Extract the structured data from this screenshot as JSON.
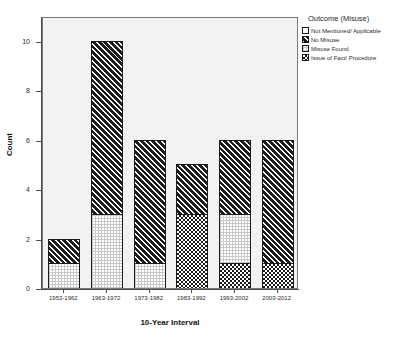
{
  "chart_data": {
    "type": "bar",
    "stacked": true,
    "title": "",
    "xlabel": "10-Year Interval",
    "ylabel": "Count",
    "ylim": [
      0,
      11
    ],
    "yticks": [
      0,
      2,
      4,
      6,
      8,
      10
    ],
    "grid": false,
    "legend_position": "right",
    "legend_title": "Outcome (Misuse)",
    "categories": [
      "1953-1962",
      "1963-1972",
      "1973-1982",
      "1983-1992",
      "1993-2002",
      "2003-2012"
    ],
    "series": [
      {
        "name": "Not Mentioned/ Applicable",
        "pattern": "blank",
        "values": [
          0,
          0,
          0,
          0,
          0,
          0
        ]
      },
      {
        "name": "No Misuse",
        "pattern": "diagonal-hatch",
        "values": [
          1,
          7,
          5,
          2,
          3,
          5
        ]
      },
      {
        "name": "Misuse Found",
        "pattern": "fine-dots",
        "values": [
          1,
          3,
          1,
          0,
          2,
          0
        ]
      },
      {
        "name": "Issue of Fact/ Procedure",
        "pattern": "checkerboard",
        "values": [
          0,
          0,
          0,
          3,
          1,
          1
        ]
      }
    ],
    "totals": [
      2,
      10,
      6,
      5,
      6,
      6
    ]
  },
  "axes": {
    "y_tick_labels": [
      "0",
      "2",
      "4",
      "6",
      "8",
      "10"
    ],
    "y_axis_title": "Count",
    "x_axis_title": "10-Year Interval",
    "x_tick_labels": [
      "1953-1962",
      "1963-1972",
      "1973-1982",
      "1983-1992",
      "1993-2002",
      "2003-2012"
    ]
  },
  "legend": {
    "title": "Outcome (Misuse)",
    "items": [
      {
        "label": "Not Mentioned/ Applicable",
        "pattern": "blank"
      },
      {
        "label": "No Misuse",
        "pattern": "diagonal-hatch"
      },
      {
        "label": "Misuse Found",
        "pattern": "fine-dots"
      },
      {
        "label": "Issue of Fact/ Procedure",
        "pattern": "checkerboard"
      }
    ]
  },
  "colors": {
    "plot_background": "#f2f2f2",
    "page_background": "#ffffff",
    "frame": "#7a7a7a",
    "axis": "#4d4d4d",
    "ink": "#1c1c1c",
    "text": "#2b2b2b"
  }
}
